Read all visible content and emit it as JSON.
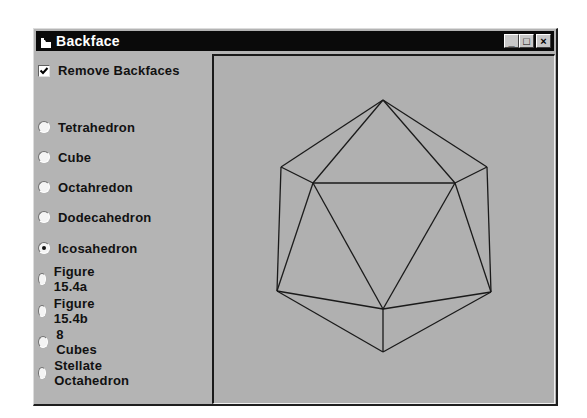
{
  "window": {
    "title": "Backface",
    "controls": {
      "minimize": "_",
      "maximize": "□",
      "close": "×"
    }
  },
  "options": {
    "remove_backfaces": {
      "label": "Remove Backfaces",
      "checked": true
    }
  },
  "shapes": {
    "selected": "Icosahedron",
    "items": [
      {
        "label": "Tetrahedron",
        "checked": false
      },
      {
        "label": "Cube",
        "checked": false
      },
      {
        "label": "Octahredon",
        "checked": false
      },
      {
        "label": "Dodecahedron",
        "checked": false
      },
      {
        "label": "Icosahedron",
        "checked": true
      },
      {
        "label": "Figure 15.4a",
        "checked": false
      },
      {
        "label": "Figure 15.4b",
        "checked": false
      },
      {
        "label": "8 Cubes",
        "checked": false
      },
      {
        "label": "Stellate Octahedron",
        "checked": false
      }
    ]
  },
  "drawing": {
    "shape": "icosahedron",
    "stroke_color": "#1a1a1a",
    "vertices": {
      "top": [
        383,
        100
      ],
      "upper_left": [
        281,
        167
      ],
      "upper_right": [
        487,
        167
      ],
      "inner_left": [
        313,
        183
      ],
      "inner_right": [
        455,
        183
      ],
      "lower_left": [
        277,
        291
      ],
      "lower_right": [
        491,
        292
      ],
      "lower_inner": [
        383,
        309
      ],
      "bottom": [
        383,
        352
      ]
    }
  }
}
